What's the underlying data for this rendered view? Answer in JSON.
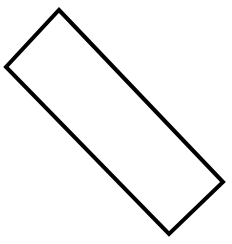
{
  "shape": {
    "type": "rectangle",
    "points": "59,10 223,182 169,234 6,67",
    "stroke": "#000000",
    "fill": "#ffffff",
    "stroke_width": "4"
  }
}
